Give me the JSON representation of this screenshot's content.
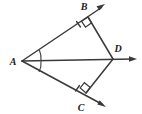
{
  "figure": {
    "background_color": "#ffffff",
    "line_color": "#3a3a3a",
    "label_color": "#1a1a1a",
    "labels": {
      "a": "A",
      "b": "B",
      "c": "C",
      "d": "D"
    },
    "points": {
      "a": {
        "x": 22,
        "y": 61
      },
      "b": {
        "x": 88,
        "y": 17
      },
      "c": {
        "x": 86,
        "y": 93
      },
      "d": {
        "x": 113,
        "y": 59
      }
    },
    "label_positions": {
      "a": {
        "x": 13,
        "y": 65
      },
      "b": {
        "x": 84,
        "y": 10
      },
      "c": {
        "x": 81,
        "y": 108
      },
      "d": {
        "x": 117,
        "y": 51
      }
    },
    "rays": [
      {
        "name": "ray-AB",
        "from": "A",
        "through": "B",
        "tip_x": 105,
        "tip_y": 4
      },
      {
        "name": "ray-AC",
        "from": "A",
        "through": "C",
        "tip_x": 106,
        "tip_y": 107
      },
      {
        "name": "ray-AD",
        "from": "A",
        "through": "D",
        "tip_x": 137,
        "tip_y": 59
      }
    ],
    "segments": [
      {
        "name": "segment-BD",
        "from": "B",
        "to": "D"
      },
      {
        "name": "segment-CD",
        "from": "C",
        "to": "D"
      }
    ],
    "right_angle_markers": [
      {
        "name": "right-angle-at-B",
        "vertex": "B"
      },
      {
        "name": "right-angle-at-C",
        "vertex": "C"
      }
    ],
    "angle_arcs": [
      {
        "name": "angle-arc-BAD",
        "vertex": "A"
      },
      {
        "name": "angle-arc-DAC",
        "vertex": "A"
      }
    ],
    "tick_marks": [
      {
        "name": "tick-on-AB",
        "segment": "AB"
      },
      {
        "name": "tick-on-AC",
        "segment": "AC"
      }
    ]
  }
}
